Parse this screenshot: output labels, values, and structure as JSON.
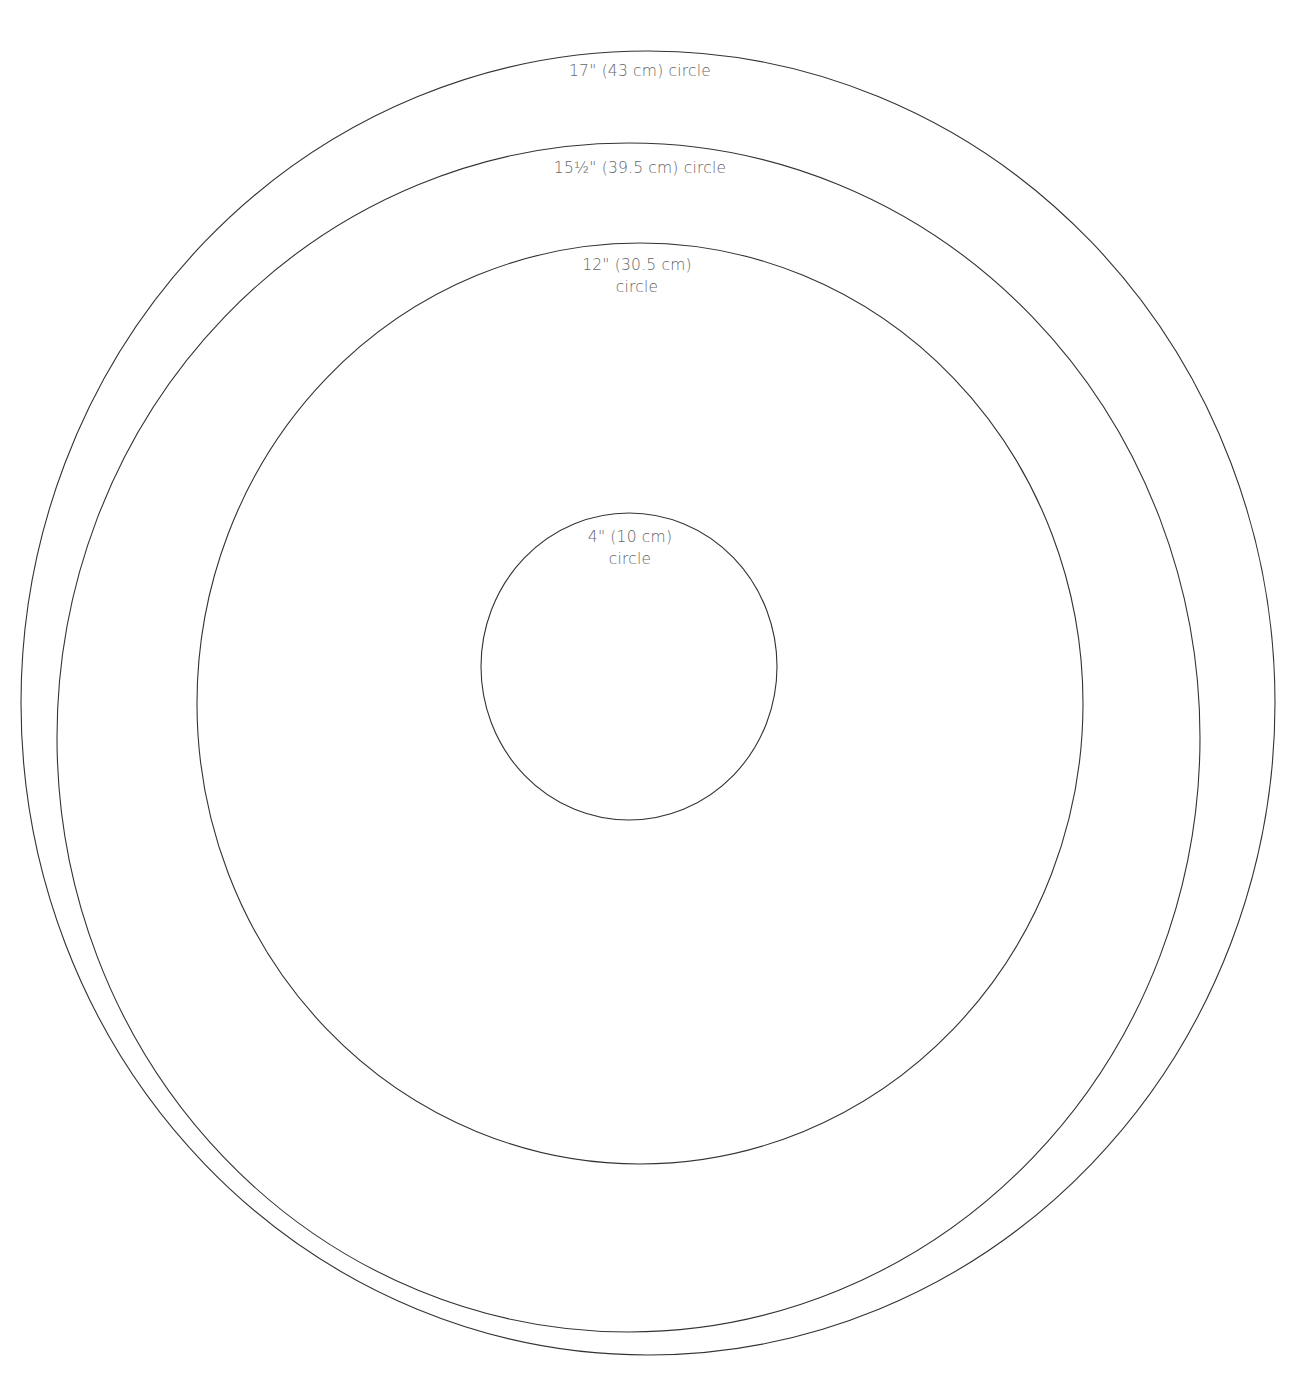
{
  "title_fragment": "",
  "colors": {
    "line": "#333333",
    "label": "#666666",
    "background": "#ffffff"
  },
  "circles": [
    {
      "id": "circle-17in",
      "label_line1": "17\" (43 cm) circle",
      "label_line2": "",
      "cx": 648,
      "cy": 703,
      "rx": 627,
      "ry": 652,
      "label_x": 640,
      "label_y": 60
    },
    {
      "id": "circle-15-5in",
      "label_line1": "15½\" (39.5 cm) circle",
      "label_line2": "",
      "cx": 628.5,
      "cy": 737.5,
      "rx": 571.5,
      "ry": 594.5,
      "label_x": 640,
      "label_y": 157
    },
    {
      "id": "circle-12in",
      "label_line1": "12\" (30.5 cm)",
      "label_line2": "circle",
      "cx": 640,
      "cy": 703.5,
      "rx": 443,
      "ry": 460.5,
      "label_x": 637,
      "label_y": 254
    },
    {
      "id": "circle-4in",
      "label_line1": "4\" (10 cm)",
      "label_line2": "circle",
      "cx": 629,
      "cy": 666.5,
      "rx": 148,
      "ry": 153.5,
      "label_x": 630,
      "label_y": 526
    }
  ]
}
